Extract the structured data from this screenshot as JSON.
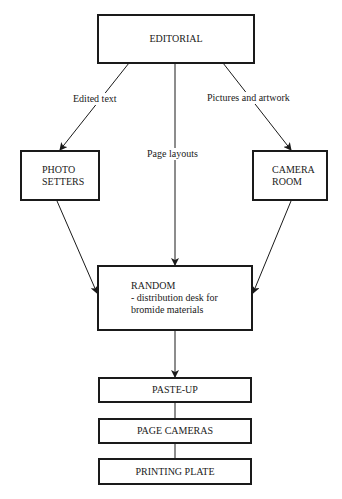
{
  "diagram": {
    "type": "flowchart",
    "nodes": {
      "editorial": {
        "label": "EDITORIAL"
      },
      "photo_setters": {
        "line1": "PHOTO",
        "line2": "SETTERS"
      },
      "camera_room": {
        "line1": "CAMERA",
        "line2": "ROOM"
      },
      "random": {
        "line1": "RANDOM",
        "line2": "- distribution desk for",
        "line3": "bromide materials"
      },
      "paste_up": {
        "label": "PASTE-UP"
      },
      "page_cameras": {
        "label": "PAGE CAMERAS"
      },
      "printing_plate": {
        "label": "PRINTING PLATE"
      }
    },
    "edges": [
      {
        "from": "EDITORIAL",
        "to": "PHOTO SETTERS",
        "label": "Edited text"
      },
      {
        "from": "EDITORIAL",
        "to": "RANDOM",
        "label": "Page layouts"
      },
      {
        "from": "EDITORIAL",
        "to": "CAMERA ROOM",
        "label": "Pictures and artwork"
      },
      {
        "from": "PHOTO SETTERS",
        "to": "RANDOM",
        "label": ""
      },
      {
        "from": "CAMERA ROOM",
        "to": "RANDOM",
        "label": ""
      },
      {
        "from": "RANDOM",
        "to": "PASTE-UP",
        "label": ""
      },
      {
        "from": "PASTE-UP",
        "to": "PAGE CAMERAS",
        "label": ""
      },
      {
        "from": "PAGE CAMERAS",
        "to": "PRINTING PLATE",
        "label": ""
      }
    ],
    "edge_labels": {
      "edited_text": "Edited text",
      "page_layouts": "Page layouts",
      "pictures_artwork": "Pictures and artwork"
    },
    "colors": {
      "stroke": "#1a1a1a",
      "background": "#ffffff"
    }
  }
}
